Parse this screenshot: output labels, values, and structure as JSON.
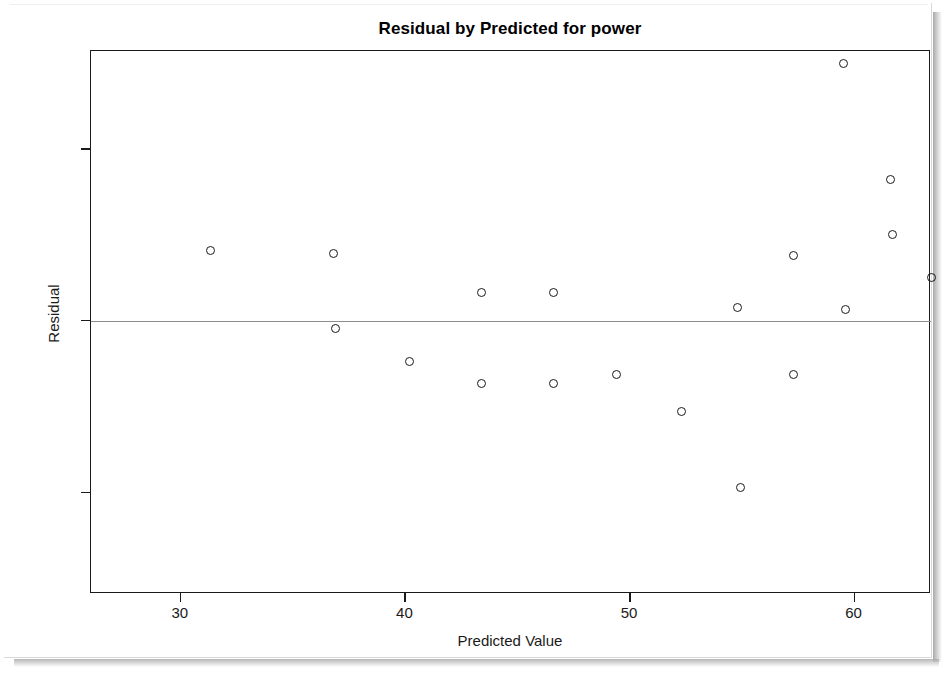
{
  "chart_data": {
    "type": "scatter",
    "title": "Residual by Predicted for power",
    "xlabel": "Predicted Value",
    "ylabel": "Residual",
    "xlim": [
      26.0,
      63.4
    ],
    "ylim": [
      -3.18,
      3.14
    ],
    "xticks": [
      30,
      40,
      50,
      60
    ],
    "xticklabels": [
      "30",
      "40",
      "50",
      "60"
    ],
    "yticks": [
      2,
      0,
      -2
    ],
    "yticklabels": [
      "2",
      "0",
      "-2"
    ],
    "grid": false,
    "legend": null,
    "reference_lines": [
      {
        "axis": "y",
        "value": 0,
        "color": "#8d8d8d"
      }
    ],
    "marker": "open-circle",
    "marker_color": "#1a1a1a",
    "points": [
      {
        "x": 31.3,
        "y": 0.82
      },
      {
        "x": 36.8,
        "y": 0.78
      },
      {
        "x": 36.9,
        "y": -0.09
      },
      {
        "x": 40.2,
        "y": -0.47
      },
      {
        "x": 43.4,
        "y": 0.33
      },
      {
        "x": 43.4,
        "y": -0.73
      },
      {
        "x": 46.6,
        "y": 0.33
      },
      {
        "x": 46.6,
        "y": -0.73
      },
      {
        "x": 49.4,
        "y": -0.63
      },
      {
        "x": 52.3,
        "y": -1.06
      },
      {
        "x": 54.8,
        "y": 0.15
      },
      {
        "x": 54.9,
        "y": -1.94
      },
      {
        "x": 57.3,
        "y": 0.76
      },
      {
        "x": 57.3,
        "y": -0.62
      },
      {
        "x": 59.5,
        "y": 2.99
      },
      {
        "x": 59.6,
        "y": 0.13
      },
      {
        "x": 61.6,
        "y": 1.65
      },
      {
        "x": 61.7,
        "y": 1.0
      },
      {
        "x": 63.4,
        "y": 0.5
      },
      {
        "x": 65.3,
        "y": 0.05
      },
      {
        "x": 66.7,
        "y": -2.96
      }
    ]
  }
}
